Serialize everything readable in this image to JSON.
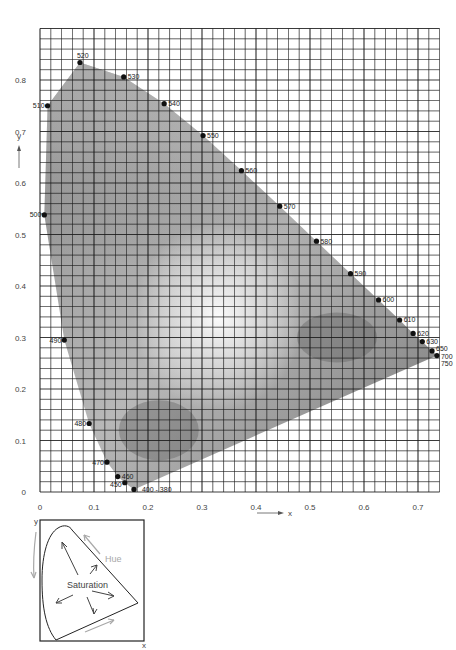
{
  "chart_data": [
    {
      "type": "scatter",
      "title": "CIE 1931 chromaticity diagram (spectral locus)",
      "xlabel": "x",
      "ylabel": "y",
      "xlim": [
        0,
        0.75
      ],
      "ylim": [
        0,
        0.85
      ],
      "grid": true,
      "grid_step": 0.02,
      "x_ticks": [
        "0",
        "0.1",
        "0.2",
        "0.3",
        "0.4",
        "0.5",
        "0.6",
        "0.7"
      ],
      "y_ticks": [
        "0",
        "0.1",
        "0.2",
        "0.3",
        "0.4",
        "0.5",
        "0.6",
        "0.7",
        "0.8"
      ],
      "points": [
        {
          "label": "400 - 380",
          "x": 0.174,
          "y": 0.005
        },
        {
          "label": "450",
          "x": 0.157,
          "y": 0.018
        },
        {
          "label": "460",
          "x": 0.144,
          "y": 0.03
        },
        {
          "label": "470",
          "x": 0.124,
          "y": 0.058
        },
        {
          "label": "480",
          "x": 0.091,
          "y": 0.133
        },
        {
          "label": "490",
          "x": 0.045,
          "y": 0.295
        },
        {
          "label": "500",
          "x": 0.008,
          "y": 0.538
        },
        {
          "label": "510",
          "x": 0.014,
          "y": 0.75
        },
        {
          "label": "520",
          "x": 0.074,
          "y": 0.834
        },
        {
          "label": "530",
          "x": 0.155,
          "y": 0.806
        },
        {
          "label": "540",
          "x": 0.23,
          "y": 0.754
        },
        {
          "label": "550",
          "x": 0.302,
          "y": 0.692
        },
        {
          "label": "560",
          "x": 0.373,
          "y": 0.624
        },
        {
          "label": "570",
          "x": 0.444,
          "y": 0.555
        },
        {
          "label": "580",
          "x": 0.512,
          "y": 0.487
        },
        {
          "label": "590",
          "x": 0.575,
          "y": 0.424
        },
        {
          "label": "600",
          "x": 0.627,
          "y": 0.373
        },
        {
          "label": "610",
          "x": 0.666,
          "y": 0.334
        },
        {
          "label": "620",
          "x": 0.691,
          "y": 0.308
        },
        {
          "label": "630",
          "x": 0.708,
          "y": 0.292
        },
        {
          "label": "650",
          "x": 0.726,
          "y": 0.274
        },
        {
          "label": "700",
          "x": 0.735,
          "y": 0.265
        },
        {
          "label": "750",
          "x": 0.735,
          "y": 0.265
        }
      ],
      "annotations": [
        "x axis arrow",
        "y axis arrow"
      ]
    },
    {
      "type": "diagram",
      "title": "Hue and saturation schematic",
      "xlabel": "x",
      "ylabel": "y",
      "annotations": [
        "Hue",
        "Saturation"
      ]
    }
  ],
  "main": {
    "x_axis_label": "x",
    "y_axis_label": "y",
    "x_ticks": [
      "0",
      "0.1",
      "0.2",
      "0.3",
      "0.4",
      "0.5",
      "0.6",
      "0.7"
    ],
    "y_ticks": [
      "0",
      "0.1",
      "0.2",
      "0.3",
      "0.4",
      "0.5",
      "0.6",
      "0.7",
      "0.8"
    ]
  },
  "inset": {
    "hue_label": "Hue",
    "saturation_label": "Saturation",
    "x_label": "x",
    "y_label": "y"
  },
  "colors": {
    "grid": "#1a1a1a",
    "locus_fill_dark": "#6e6e6e",
    "locus_fill_light": "#f4f4f4",
    "hue_arrow": "#a8a8a8",
    "sat_arrow": "#444444"
  }
}
